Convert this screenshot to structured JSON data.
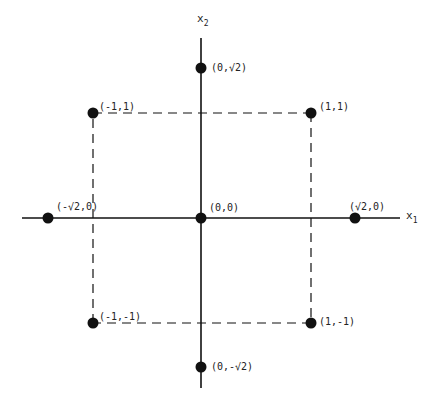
{
  "diagram": {
    "type": "coordinate-plane-points",
    "origin_px": [
      201,
      218
    ],
    "unit_px": [
      109,
      105
    ],
    "axes": {
      "x": {
        "label": "x",
        "subscript": "1",
        "from_px": 22,
        "to_px": 400
      },
      "y": {
        "label": "x",
        "subscript": "2",
        "from_px": 38,
        "to_px": 388
      }
    },
    "square": {
      "style": "dashed",
      "corners": [
        "(-1,1)",
        "(1,1)",
        "(1,-1)",
        "(-1,-1)"
      ]
    },
    "points": [
      {
        "id": "p-0-sqrt2",
        "label": "(0,√2)",
        "px": [
          201,
          68
        ],
        "label_offset": [
          10,
          3
        ]
      },
      {
        "id": "p-m1-1",
        "label": "(-1,1)",
        "px": [
          93,
          113
        ],
        "label_offset": [
          6,
          -3
        ]
      },
      {
        "id": "p-1-1",
        "label": "(1,1)",
        "px": [
          311,
          113
        ],
        "label_offset": [
          8,
          -3
        ]
      },
      {
        "id": "p-msqrt2-0",
        "label": "(-√2,0)",
        "px": [
          48,
          218
        ],
        "label_offset": [
          8,
          -8
        ]
      },
      {
        "id": "p-0-0",
        "label": "(0,0)",
        "px": [
          201,
          218
        ],
        "label_offset": [
          8,
          -7
        ]
      },
      {
        "id": "p-sqrt2-0",
        "label": "(√2,0)",
        "px": [
          355,
          218
        ],
        "label_offset": [
          -6,
          -8
        ]
      },
      {
        "id": "p-m1-m1",
        "label": "(-1,-1)",
        "px": [
          93,
          323
        ],
        "label_offset": [
          6,
          -3
        ]
      },
      {
        "id": "p-1-m1",
        "label": "(1,-1)",
        "px": [
          311,
          323
        ],
        "label_offset": [
          8,
          2
        ]
      },
      {
        "id": "p-0-msqrt2",
        "label": "(0,-√2)",
        "px": [
          201,
          367
        ],
        "label_offset": [
          10,
          3
        ]
      }
    ],
    "colors": {
      "ink": "#111111",
      "background": "#ffffff"
    }
  }
}
